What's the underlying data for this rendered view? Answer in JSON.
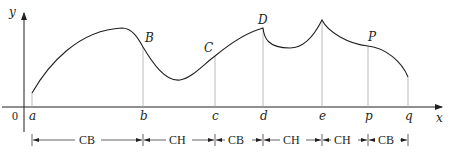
{
  "diagram": {
    "axes": {
      "x_label": "x",
      "y_label": "y",
      "origin_label": "0"
    },
    "x_ticks": [
      {
        "id": "a",
        "label": "a",
        "px": 32
      },
      {
        "id": "b",
        "label": "b",
        "px": 143
      },
      {
        "id": "c",
        "label": "c",
        "px": 215
      },
      {
        "id": "d",
        "label": "d",
        "px": 263
      },
      {
        "id": "e",
        "label": "e",
        "px": 322
      },
      {
        "id": "p",
        "label": "p",
        "px": 368
      },
      {
        "id": "q",
        "label": "q",
        "px": 408
      }
    ],
    "points": [
      {
        "id": "B",
        "label": "B",
        "note": "inflection point"
      },
      {
        "id": "C",
        "label": "C",
        "note": "inflection point"
      },
      {
        "id": "D",
        "label": "D",
        "note": "cusp / local max"
      },
      {
        "id": "P",
        "label": "P",
        "note": "inflection point"
      }
    ],
    "intervals": [
      {
        "from": "a",
        "to": "b",
        "label": "CB"
      },
      {
        "from": "b",
        "to": "c",
        "label": "CH"
      },
      {
        "from": "c",
        "to": "d",
        "label": "CB"
      },
      {
        "from": "d",
        "to": "e",
        "label": "CH"
      },
      {
        "from": "e",
        "to": "p",
        "label": "CH"
      },
      {
        "from": "p",
        "to": "q",
        "label": "CB"
      }
    ],
    "colors": {
      "ink": "#231f20",
      "guide": "#a7a9ac"
    }
  }
}
